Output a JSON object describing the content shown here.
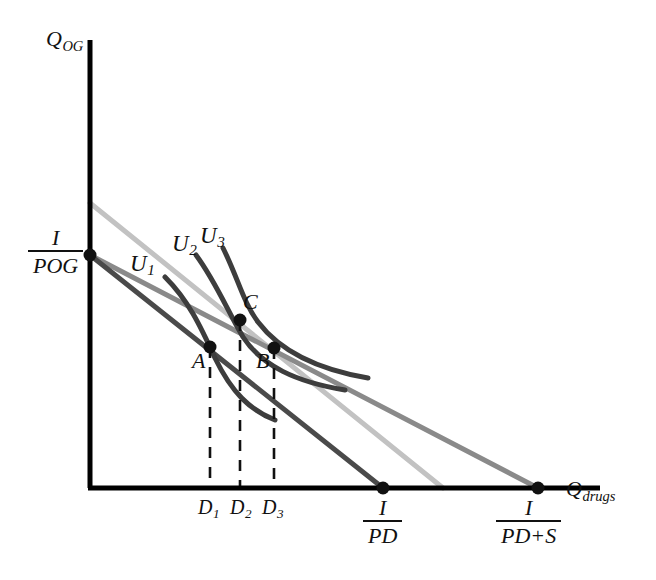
{
  "figure": {
    "type": "economics-indifference-curve-diagram",
    "background": "#ffffff"
  },
  "axes": {
    "y_label_main": "Q",
    "y_label_sub": "OG",
    "x_label_main": "Q",
    "x_label_sub": "drugs",
    "origin_px": [
      90,
      488
    ],
    "y_top_px": [
      90,
      40
    ],
    "x_right_px": [
      600,
      488
    ],
    "color": "#000000"
  },
  "intercepts": {
    "y_intercept": {
      "numerator": "I",
      "denominator_main": "P",
      "denominator_sub": "OG",
      "px": [
        90,
        255
      ]
    },
    "x_intercept_1": {
      "numerator": "I",
      "denominator_main": "P",
      "denominator_sub": "D",
      "px": [
        383,
        488
      ]
    },
    "x_intercept_2": {
      "numerator": "I",
      "denominator_main": "P",
      "denominator_sub": "D",
      "denominator_extra": "+S",
      "px": [
        538,
        488
      ]
    }
  },
  "budget_lines": [
    {
      "name": "original-budget-line",
      "color": "#4a4a4a",
      "width": 5,
      "from_px": [
        90,
        255
      ],
      "to_px": [
        383,
        488
      ],
      "note": "price P_D"
    },
    {
      "name": "subsidized-budget-line",
      "color": "#8a8a8a",
      "width": 5,
      "from_px": [
        90,
        255
      ],
      "to_px": [
        538,
        488
      ],
      "note": "price P_D + S"
    },
    {
      "name": "compensated-budget-line",
      "color": "#c2c2c2",
      "width": 5,
      "from_px": [
        90,
        203
      ],
      "to_px": [
        443,
        488
      ],
      "note": "compensated, parallel to subsidized"
    }
  ],
  "indifference_curves": [
    {
      "label_main": "U",
      "label_sub": "1",
      "name": "indifference-curve-u1",
      "color": "#3d3d3d",
      "width": 5,
      "label_px": [
        130,
        252
      ],
      "path": "M165,277 C188,300 200,325 215,358 C232,393 250,410 275,420"
    },
    {
      "label_main": "U",
      "label_sub": "2",
      "name": "indifference-curve-u2",
      "color": "#3d3d3d",
      "width": 5,
      "label_px": [
        172,
        232
      ],
      "path": "M196,255 C216,282 228,312 243,337 C262,366 296,382 345,390"
    },
    {
      "label_main": "U",
      "label_sub": "3",
      "name": "indifference-curve-u3",
      "color": "#3d3d3d",
      "width": 5,
      "label_px": [
        200,
        224
      ],
      "path": "M223,248 C238,278 243,302 258,322 C280,351 315,369 368,378"
    }
  ],
  "points": [
    {
      "label": "A",
      "name": "tangency-point-a",
      "px": [
        210,
        347
      ],
      "label_px": [
        192,
        352
      ]
    },
    {
      "label": "B",
      "name": "tangency-point-b",
      "px": [
        274,
        348
      ],
      "label_px": [
        256,
        352
      ]
    },
    {
      "label": "C",
      "name": "tangency-point-c",
      "px": [
        240,
        320
      ],
      "label_px": [
        244,
        292
      ]
    }
  ],
  "dashed_drops": [
    {
      "name": "drop-line-d1",
      "x_px": 210,
      "from_y_px": 347,
      "to_y_px": 488,
      "tick_label_main": "D",
      "tick_label_sub": "1",
      "tick_label_px": [
        199,
        496
      ]
    },
    {
      "name": "drop-line-d2",
      "x_px": 240,
      "from_y_px": 320,
      "to_y_px": 488,
      "tick_label_main": "D",
      "tick_label_sub": "2",
      "tick_label_px": [
        230,
        496
      ]
    },
    {
      "name": "drop-line-d3",
      "x_px": 274,
      "from_y_px": 348,
      "to_y_px": 488,
      "tick_label_main": "D",
      "tick_label_sub": "3",
      "tick_label_px": [
        262,
        496
      ]
    }
  ],
  "colors": {
    "axis": "#000000",
    "budget_dark": "#4a4a4a",
    "budget_medium": "#8a8a8a",
    "budget_light": "#c2c2c2",
    "curve": "#3d3d3d",
    "dashed": "#111111",
    "point": "#111111"
  }
}
